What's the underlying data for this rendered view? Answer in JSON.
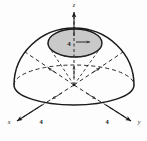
{
  "figure": {
    "background_color": "#fdfdfd",
    "stroke_color": "#1a1a1a",
    "cap_fill_color": "#c9c9c9",
    "axes": {
      "z": {
        "label": "z",
        "x": 74,
        "y": 7
      },
      "x": {
        "label": "x",
        "x": 9,
        "y": 124
      },
      "y": {
        "label": "y",
        "x": 139,
        "y": 124
      }
    },
    "dimension_labels": [
      {
        "name": "cap-radius",
        "value": "4",
        "x": 69,
        "y": 43
      },
      {
        "name": "x-axis-radius",
        "value": "4",
        "x": 41,
        "y": 123
      },
      {
        "name": "y-axis-radius",
        "value": "4",
        "x": 107,
        "y": 123
      }
    ],
    "geometry": {
      "origin_x": 74,
      "origin_y": 85,
      "dome_radius_x": 60,
      "dome_radius_y": 57,
      "equator_ry": 20,
      "cap_cx": 75,
      "cap_cy": 43,
      "cap_rx": 27,
      "cap_ry": 14
    }
  }
}
